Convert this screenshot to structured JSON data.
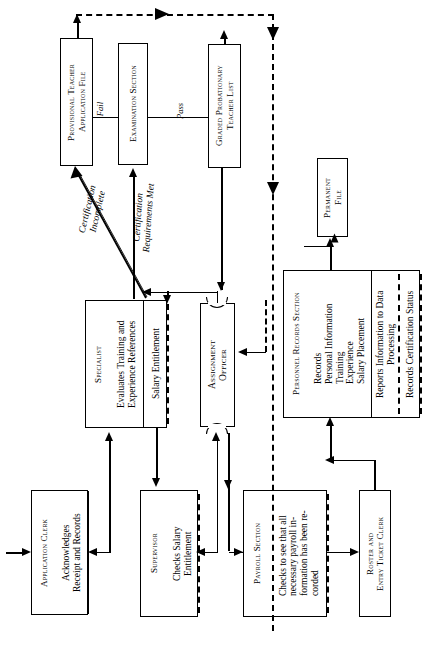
{
  "diagram": {
    "orientation": "landscape-rotated-90",
    "nodes": {
      "provisional_file": {
        "title": "Provisional Teacher\nApplication File"
      },
      "examination_section": {
        "title": "Examination Section"
      },
      "graded_list": {
        "title": "Graded Probationary\nTeacher  List"
      },
      "permanent_file": {
        "title": "Permanent\nFile"
      },
      "specialist": {
        "title": "Specialist",
        "duty_1": "Evaluates Training and\nExperience References",
        "duty_2": "Salary Entitlement"
      },
      "assignment_officer": {
        "title": "Assignment\nOfficer"
      },
      "personnel_records": {
        "title": "Personnel Records Section",
        "duty_1": "Records\nPersonal Information\nTraining\nExperience\nSalary Placement",
        "duty_2": "Reports Information to Data\nProcessing",
        "duty_3": "Records Certification Status"
      },
      "application_clerk": {
        "title": "Application Clerk",
        "duty_1": "Acknowledges\nReceipt and Records"
      },
      "supervisor": {
        "title": "Supervisor",
        "duty_1": "Checks Salary\nEntitlement"
      },
      "payroll_section": {
        "title": "Payroll Section",
        "duty_1": "Checks to see that all\nnecessary  payroll  in-\nformation has been re-\ncorded"
      },
      "roster_clerk": {
        "title": "Roster and\nEntry Ticket Clerk"
      }
    },
    "edge_labels": {
      "fail": "Fail",
      "pass": "Pass",
      "certification_incomplete": "Certification\nIncomplete",
      "certification_requirements_met": "Certification\nRequirements Met"
    },
    "colors": {
      "ink": "#000000",
      "paper": "#ffffff"
    }
  }
}
